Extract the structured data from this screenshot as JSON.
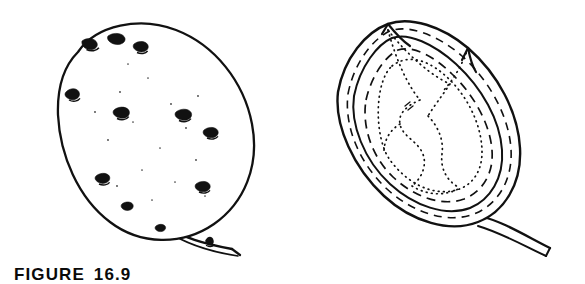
{
  "figure": {
    "caption_label": "FIGURE",
    "caption_number": "16.9",
    "ink_color": "#111111",
    "background_color": "#ffffff"
  },
  "panels": [
    {
      "id": "external",
      "name": "potato-tuber-external-view",
      "description": "Whole potato tuber, external surface, stipple-shaded",
      "features": {
        "surface_texture": "stipple",
        "eye_count": 7,
        "stolon": "attached at basal end, lower right",
        "stolon_node_count": 1
      }
    },
    {
      "id": "section",
      "name": "potato-tuber-longitudinal-section",
      "description": "Longitudinal section of the same tuber showing internal tissue zones",
      "features": {
        "periderm_line": "solid",
        "vascular_ring_line": "dashed",
        "pith_line": "dotted",
        "apical_bud": "top left",
        "stolon": "attached at basal end, lower right"
      }
    }
  ]
}
